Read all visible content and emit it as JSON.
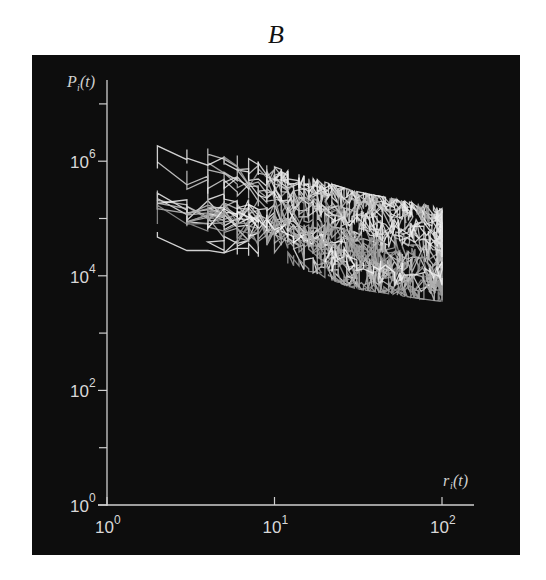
{
  "figure": {
    "panel_letter": "B",
    "background_color": "#0d0d0d",
    "line_color": "#e8e8e8"
  },
  "chart_data": {
    "type": "line",
    "title": "B",
    "xlabel": "r_i(t)",
    "ylabel": "P_i(t)",
    "xscale": "log",
    "yscale": "log",
    "xlim": [
      1,
      200
    ],
    "ylim": [
      1,
      20000000
    ],
    "x_ticks": [
      {
        "value": 1,
        "base": "10",
        "exp": "0"
      },
      {
        "value": 10,
        "base": "10",
        "exp": "1"
      },
      {
        "value": 100,
        "base": "10",
        "exp": "2"
      }
    ],
    "y_ticks": [
      {
        "value": 1,
        "base": "10",
        "exp": "0"
      },
      {
        "value": 100,
        "base": "10",
        "exp": "2"
      },
      {
        "value": 10000,
        "base": "10",
        "exp": "4"
      },
      {
        "value": 1000000,
        "base": "10",
        "exp": "6"
      }
    ],
    "y_minor_ticks": [
      10,
      1000,
      100000,
      10000000
    ],
    "grid": false,
    "legend": null,
    "envelope": {
      "upper": [
        [
          2,
          3300000
        ],
        [
          5,
          1500000
        ],
        [
          10,
          800000
        ],
        [
          30,
          300000
        ],
        [
          100,
          150000
        ]
      ],
      "lower": [
        [
          2,
          30000
        ],
        [
          5,
          25000
        ],
        [
          10,
          20000
        ],
        [
          30,
          6000
        ],
        [
          100,
          3500
        ]
      ]
    },
    "series_count_estimate": 60
  }
}
